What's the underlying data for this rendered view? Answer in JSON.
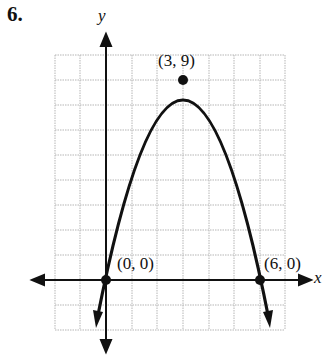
{
  "problem_number": "6.",
  "axes": {
    "x_label": "x",
    "y_label": "y"
  },
  "points": [
    {
      "label": "(3, 9)",
      "x": 3,
      "y": 9,
      "role": "vertex"
    },
    {
      "label": "(0, 0)",
      "x": 0,
      "y": 0,
      "role": "x-intercept"
    },
    {
      "label": "(6, 0)",
      "x": 6,
      "y": 0,
      "role": "x-intercept"
    }
  ],
  "curve": {
    "type": "parabola",
    "opens": "down",
    "equation_form": "y = -x^2 + 6x"
  }
}
